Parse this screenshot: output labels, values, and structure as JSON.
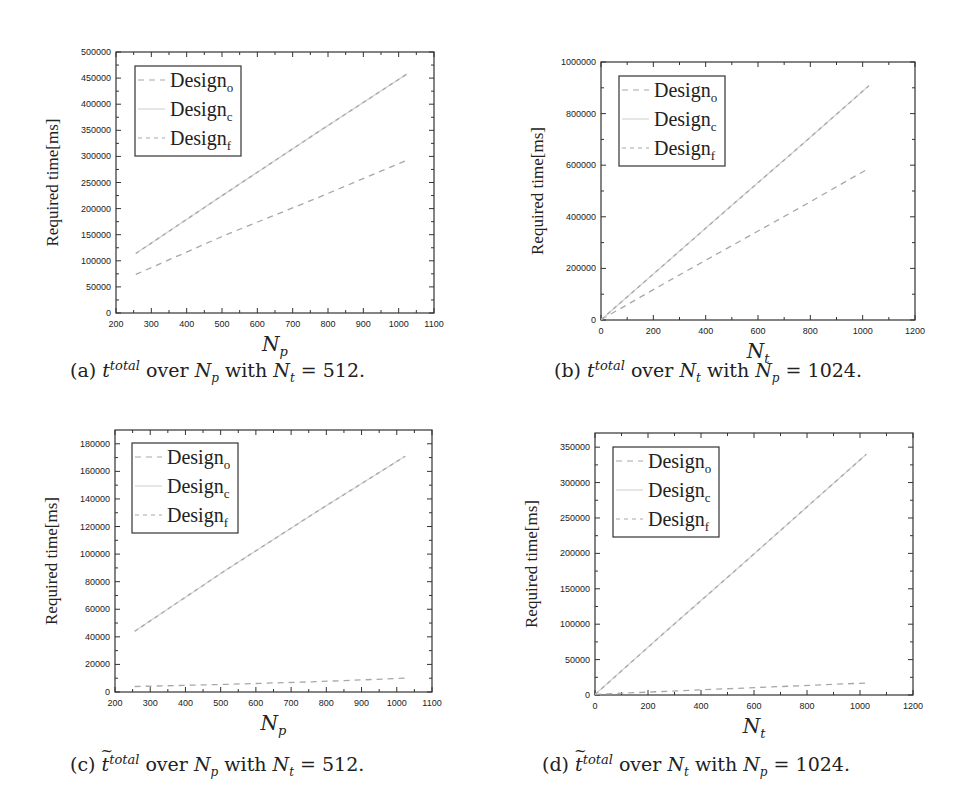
{
  "figure": {
    "panels": [
      {
        "id": "a",
        "caption": {
          "label": "(a)",
          "symbol": "t",
          "symbol_sup": "total",
          "tilde": false,
          "over": "over",
          "var": "N",
          "var_sub": "p",
          "with": "with",
          "fixed": "N",
          "fixed_sub": "t",
          "eq": "= 512."
        },
        "xlabel": "N",
        "xlabel_sub": "p",
        "ylabel": "Required time[ms]"
      },
      {
        "id": "b",
        "caption": {
          "label": "(b)",
          "symbol": "t",
          "symbol_sup": "total",
          "tilde": false,
          "over": "over",
          "var": "N",
          "var_sub": "t",
          "with": "with",
          "fixed": "N",
          "fixed_sub": "p",
          "eq": "= 1024."
        },
        "xlabel": "N",
        "xlabel_sub": "t",
        "ylabel": "Required time[ms]"
      },
      {
        "id": "c",
        "caption": {
          "label": "(c)",
          "symbol": "t",
          "symbol_sup": "total",
          "tilde": true,
          "over": "over",
          "var": "N",
          "var_sub": "p",
          "with": "with",
          "fixed": "N",
          "fixed_sub": "t",
          "eq": "= 512."
        },
        "xlabel": "N",
        "xlabel_sub": "p",
        "ylabel": "Required time[ms]"
      },
      {
        "id": "d",
        "caption": {
          "label": "(d)",
          "symbol": "t",
          "symbol_sup": "total",
          "tilde": true,
          "over": "over",
          "var": "N",
          "var_sub": "t",
          "with": "with",
          "fixed": "N",
          "fixed_sub": "p",
          "eq": "= 1024."
        },
        "xlabel": "N",
        "xlabel_sub": "t",
        "ylabel": "Required time[ms]"
      }
    ],
    "legend": [
      {
        "base": "Design",
        "sub": "o",
        "style": "dashed"
      },
      {
        "base": "Design",
        "sub": "c",
        "style": "solid"
      },
      {
        "base": "Design",
        "sub": "f",
        "style": "dotted-dash"
      }
    ],
    "colors": {
      "line": "#a8a8a8",
      "line_light": "#d6d6d6",
      "frame": "#333333",
      "text": "#222222"
    }
  },
  "chart_data": [
    {
      "type": "line",
      "title": "(a) t^total over N_p with N_t = 512.",
      "xlabel": "N_p",
      "ylabel": "Required time[ms]",
      "xlim": [
        200,
        1100
      ],
      "ylim": [
        0,
        500000
      ],
      "xticks": [
        200,
        300,
        400,
        500,
        600,
        700,
        800,
        900,
        1000,
        1100
      ],
      "yticks": [
        0,
        50000,
        100000,
        150000,
        200000,
        250000,
        300000,
        350000,
        400000,
        450000,
        500000
      ],
      "grid": false,
      "legend_position": "upper left",
      "x": [
        256,
        512,
        768,
        1024
      ],
      "series": [
        {
          "name": "Design_o",
          "values": [
            74000,
            150000,
            220000,
            293000
          ]
        },
        {
          "name": "Design_c",
          "values": [
            114000,
            230000,
            345000,
            458000
          ]
        },
        {
          "name": "Design_f",
          "values": [
            114000,
            230000,
            345000,
            458000
          ]
        }
      ]
    },
    {
      "type": "line",
      "title": "(b) t^total over N_t with N_p = 1024.",
      "xlabel": "N_t",
      "ylabel": "Required time[ms]",
      "xlim": [
        0,
        1200
      ],
      "ylim": [
        0,
        1000000
      ],
      "xticks": [
        0,
        200,
        400,
        600,
        800,
        1000,
        1200
      ],
      "yticks": [
        0,
        200000,
        400000,
        600000,
        800000,
        1000000
      ],
      "grid": false,
      "legend_position": "upper left",
      "x": [
        1,
        256,
        512,
        768,
        1024
      ],
      "series": [
        {
          "name": "Design_o",
          "values": [
            2000,
            150000,
            295000,
            440000,
            588000
          ]
        },
        {
          "name": "Design_c",
          "values": [
            2000,
            228000,
            455000,
            680000,
            908000
          ]
        },
        {
          "name": "Design_f",
          "values": [
            2000,
            228000,
            455000,
            680000,
            908000
          ]
        }
      ]
    },
    {
      "type": "line",
      "title": "(c) ~t^total over N_p with N_t = 512.",
      "xlabel": "N_p",
      "ylabel": "Required time[ms]",
      "xlim": [
        200,
        1100
      ],
      "ylim": [
        0,
        190000
      ],
      "xticks": [
        200,
        300,
        400,
        500,
        600,
        700,
        800,
        900,
        1000,
        1100
      ],
      "yticks": [
        0,
        20000,
        40000,
        60000,
        80000,
        100000,
        120000,
        140000,
        160000,
        180000
      ],
      "grid": false,
      "legend_position": "upper left",
      "x": [
        256,
        512,
        768,
        1024
      ],
      "series": [
        {
          "name": "Design_o",
          "values": [
            4000,
            5500,
            7500,
            10000
          ]
        },
        {
          "name": "Design_c",
          "values": [
            44000,
            88000,
            130000,
            171000
          ]
        },
        {
          "name": "Design_f",
          "values": [
            44000,
            88000,
            130000,
            171000
          ]
        }
      ]
    },
    {
      "type": "line",
      "title": "(d) ~t^total over N_t with N_p = 1024.",
      "xlabel": "N_t",
      "ylabel": "Required time[ms]",
      "xlim": [
        0,
        1200
      ],
      "ylim": [
        0,
        370000
      ],
      "xticks": [
        0,
        200,
        400,
        600,
        800,
        1000,
        1200
      ],
      "yticks": [
        0,
        50000,
        100000,
        150000,
        200000,
        250000,
        300000,
        350000
      ],
      "grid": false,
      "legend_position": "upper left",
      "x": [
        1,
        256,
        512,
        768,
        1024
      ],
      "series": [
        {
          "name": "Design_o",
          "values": [
            1000,
            5000,
            9000,
            13000,
            17000
          ]
        },
        {
          "name": "Design_c",
          "values": [
            1000,
            86000,
            170000,
            255000,
            340000
          ]
        },
        {
          "name": "Design_f",
          "values": [
            1000,
            86000,
            170000,
            255000,
            340000
          ]
        }
      ]
    }
  ]
}
